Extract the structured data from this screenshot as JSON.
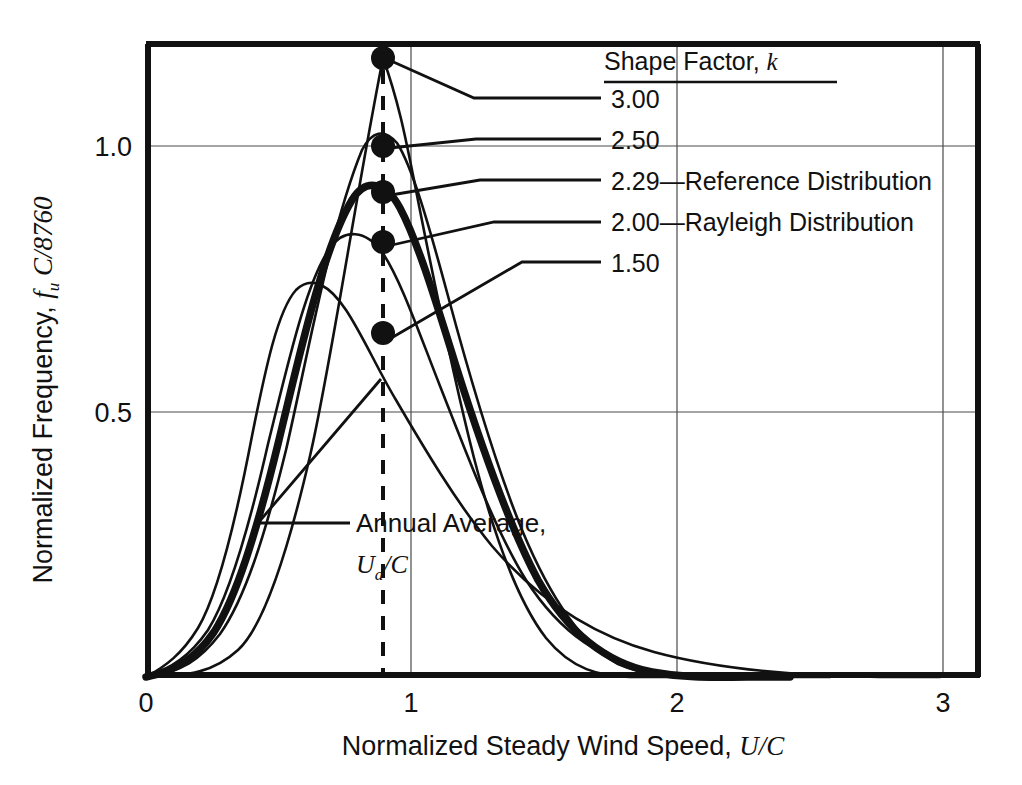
{
  "figure": {
    "background_color": "#ffffff",
    "ink_color": "#111111"
  },
  "chart_data": {
    "type": "line",
    "title": "",
    "xlabel": "Normalized Steady Wind Speed, U/C",
    "ylabel": "Normalized Frequency, f_u C/8760",
    "xlabel_parts": {
      "text": "Normalized Steady Wind Speed, ",
      "italic": "U/C"
    },
    "ylabel_parts": {
      "text": "Normalized Frequency, ",
      "italic_f": "f",
      "sub": "u",
      "italic_c": " C/8760"
    },
    "xlim": [
      0,
      3.15
    ],
    "ylim": [
      0,
      1.27
    ],
    "xticks": [
      0,
      1,
      2,
      3
    ],
    "xtick_labels": [
      "0",
      "1",
      "2",
      "3"
    ],
    "yticks": [
      0.5,
      1.0
    ],
    "ytick_labels": [
      "0.5",
      "1.0"
    ],
    "grid": "light gridlines at y=0.5, y=1.0 and x=1, x=2, x=3",
    "legend_position": "upper-right inside axes",
    "legend_title": "Shape Factor, k",
    "legend_title_italic": "k",
    "annotation_vertical_line": {
      "label": "Annual Average,",
      "label2_italic": "U",
      "label2_sub": "a",
      "label2_rest": "/C",
      "x_value": 0.89,
      "style": "dashed"
    },
    "series": [
      {
        "name": "3.00",
        "k": 3.0,
        "label": "3.00",
        "note": "",
        "linewidth": 2,
        "peak": {
          "x": 0.89,
          "y": 1.165
        },
        "marker_at_annual_average": {
          "x": 0.89,
          "y": 1.165
        }
      },
      {
        "name": "2.50",
        "k": 2.5,
        "label": "2.50",
        "note": "",
        "linewidth": 2,
        "peak": {
          "x": 0.83,
          "y": 1.005
        },
        "marker_at_annual_average": {
          "x": 0.89,
          "y": 1.0
        }
      },
      {
        "name": "2.29",
        "k": 2.29,
        "label": "2.29",
        "note": "—Reference Distribution",
        "full_label": "2.29—Reference Distribution",
        "linewidth": 6,
        "peak": {
          "x": 0.79,
          "y": 0.925
        },
        "marker_at_annual_average": {
          "x": 0.89,
          "y": 0.912
        }
      },
      {
        "name": "2.00",
        "k": 2.0,
        "label": "2.00",
        "note": "—Rayleigh Distribution",
        "full_label": "2.00—Rayleigh Distribution",
        "linewidth": 2,
        "peak": {
          "x": 0.72,
          "y": 0.855
        },
        "marker_at_annual_average": {
          "x": 0.89,
          "y": 0.818
        }
      },
      {
        "name": "1.50",
        "k": 1.5,
        "label": "1.50",
        "note": "",
        "linewidth": 2,
        "peak": {
          "x": 0.58,
          "y": 0.735
        },
        "marker_at_annual_average": {
          "x": 0.89,
          "y": 0.648
        }
      }
    ],
    "legend_entries": [
      {
        "value": "3.00",
        "note": ""
      },
      {
        "value": "2.50",
        "note": ""
      },
      {
        "value": "2.29",
        "note": "—Reference Distribution"
      },
      {
        "value": "2.00",
        "note": "—Rayleigh Distribution"
      },
      {
        "value": "1.50",
        "note": ""
      }
    ]
  }
}
